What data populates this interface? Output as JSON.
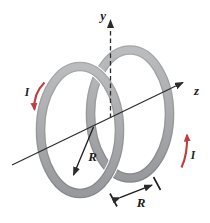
{
  "figure": {
    "type": "physics-diagram",
    "axes": {
      "vertical_axis_label": "y",
      "horizontal_axis_label": "z"
    },
    "coils": {
      "left_coil_current_label": "I",
      "right_coil_current_label": "I",
      "radius_label": "R",
      "separation_label": "R"
    },
    "colors": {
      "ring_gray_light": "#b8babc",
      "ring_gray_dark": "#97999c",
      "ring_edge": "#8a8c90",
      "current_arrow_red": "#c23b42",
      "axis_black": "#2b2b2b",
      "background": "#ffffff"
    }
  }
}
